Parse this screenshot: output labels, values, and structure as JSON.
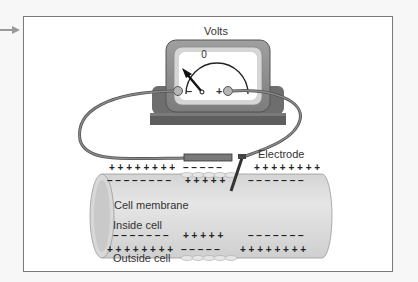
{
  "diagram": {
    "meter": {
      "title": "Volts",
      "zero_label": "0",
      "minus_label": "–",
      "plus_label": "+"
    },
    "labels": {
      "electrode": "Electrode",
      "cell_membrane": "Cell membrane",
      "inside_cell": "Inside cell",
      "outside_cell": "Outside cell"
    },
    "charges": {
      "outer_top_left": "+ + + + + + + +",
      "outer_top_mid": "– – – – –",
      "outer_top_right": "+ + + + + + + +",
      "inner_top_left": "– – – – – – – –",
      "inner_top_mid": "+ + + + +",
      "inner_top_right": "– – – – – – –",
      "inner_bottom_left": "– – – – – – –",
      "inner_bottom_mid": "+ + + + +",
      "inner_bottom_right": "– – – – – – –",
      "outer_bottom_left": "+ + + + + + + +",
      "outer_bottom_mid": "– – – – –",
      "outer_bottom_right": "+ + + + + + + +"
    },
    "colors": {
      "meter_body": "#8c8c8c",
      "meter_face_border": "#c8c8c8",
      "meter_base": "#6e6e6e",
      "wire": "#6a6a6a",
      "cell_fill": "#dcdcdc",
      "text": "#333333",
      "frame_border": "#7a7a7a"
    }
  }
}
